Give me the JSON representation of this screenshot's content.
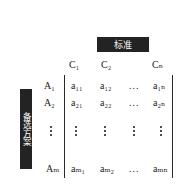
{
  "figure": {
    "type": "decision-matrix",
    "criteria_header": "标准",
    "alternatives_header": "备选方案",
    "column_headers": [
      "C₁",
      "C₂",
      "Cₙ"
    ],
    "column_ellipsis": "...",
    "row_labels": [
      "A₁",
      "A₂",
      "Aₘ"
    ],
    "row_ellipsis": "⋮",
    "matrix": {
      "row1": [
        "a₁₁",
        "a₁₂",
        "...",
        "a₁ₙ"
      ],
      "row2": [
        "a₂₁",
        "a₂₂",
        "...",
        "a₂ₙ"
      ],
      "rowm": [
        "aₘ₁",
        "aₘ₂",
        "...",
        "aₘₙ"
      ]
    },
    "colors": {
      "plate_background": "#232323",
      "plate_text": "#ffffff",
      "rule": "#2a2a2a",
      "text": "#1a1a1a",
      "background": "#ffffff"
    }
  }
}
